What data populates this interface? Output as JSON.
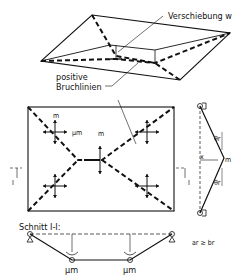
{
  "labels": {
    "displacement": "Verschiebung w",
    "positive_yield_lines_1": "positive",
    "positive_yield_lines_2": "Bruchlinien",
    "moment_mu_m": "µm",
    "moment_m": "m",
    "section_mark": "I",
    "section_title": "Schnitt I-I:",
    "x_label": "x",
    "theta_r": "θr",
    "condition": "ar ≥ br",
    "support_mu_m_left": "µm",
    "support_mu_m_right": "µm"
  }
}
